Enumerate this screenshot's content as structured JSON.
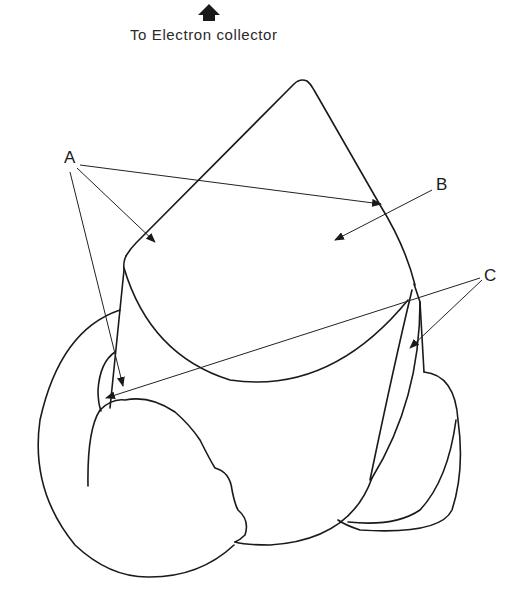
{
  "header": {
    "arrow_icon": "up-arrow-icon",
    "caption": "To Electron collector"
  },
  "labels": {
    "a": "A",
    "b": "B",
    "c": "C"
  },
  "colors": {
    "line": "#1a1a1a",
    "background": "#ffffff"
  }
}
